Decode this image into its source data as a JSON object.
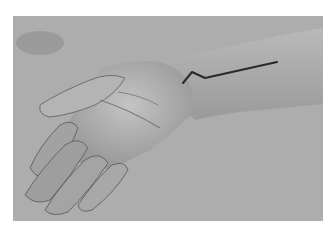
{
  "image": {
    "description": "Grayscale photograph of a left forearm and hand resting palm-inward on a gray surface, with a surgical incision line drawn on the wrist/forearm",
    "colors": {
      "border": "#ffffff",
      "background": "#acacac",
      "skin": "#b8b8b8",
      "skin_shadow": "#8a8a8a",
      "marker_line": "#2a2a2a"
    },
    "marker_line_points": [
      [
        183,
        83
      ],
      [
        192,
        72
      ],
      [
        205,
        78
      ],
      [
        277,
        62
      ]
    ]
  }
}
